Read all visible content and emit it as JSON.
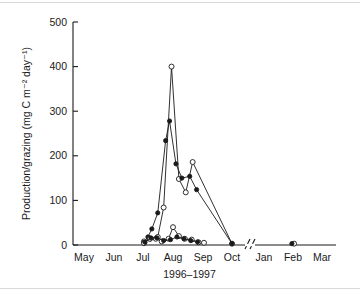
{
  "figure": {
    "background": "#ffffff",
    "ink_color": "#1a1a1a",
    "border_color": "#d9d9d9"
  },
  "chart_data": {
    "type": "line",
    "title": "",
    "subtitle": "",
    "xlabel": "1996–1997",
    "ylabel": "Production/grazing (mg C m⁻² day⁻¹)",
    "ylim": [
      0,
      500
    ],
    "yticks": [
      0,
      100,
      200,
      300,
      400,
      500
    ],
    "ytick_labels": [
      "0",
      "100",
      "200",
      "300",
      "400",
      "500"
    ],
    "xtick_labels": [
      "May",
      "Jun",
      "Jul",
      "Aug",
      "Sep",
      "Oct",
      "Jan",
      "Feb",
      "Mar"
    ],
    "x_axis_break": {
      "present": true,
      "between": [
        "Oct",
        "Jan"
      ],
      "glyph": "//"
    },
    "grid": false,
    "legend": {
      "present": false,
      "position": "none"
    },
    "marker_styles": {
      "open": "open-circle",
      "filled": "filled-circle"
    },
    "series": [
      {
        "name": "production-open-circles",
        "marker": "open-circle",
        "points": [
          {
            "x": "Jul-02",
            "y": 8
          },
          {
            "x": "Jul-08",
            "y": 14
          },
          {
            "x": "Jul-16",
            "y": 18
          },
          {
            "x": "Jul-22",
            "y": 84
          },
          {
            "x": "Jul-30",
            "y": 400
          },
          {
            "x": "Aug-07",
            "y": 148
          },
          {
            "x": "Aug-14",
            "y": 118
          },
          {
            "x": "Aug-21",
            "y": 186
          },
          {
            "x": "Oct-01",
            "y": 3
          },
          {
            "x": "Feb-10",
            "y": 3
          }
        ]
      },
      {
        "name": "grazing-filled-circles",
        "marker": "filled-circle",
        "points": [
          {
            "x": "Jul-02",
            "y": 6
          },
          {
            "x": "Jul-06",
            "y": 18
          },
          {
            "x": "Jul-10",
            "y": 36
          },
          {
            "x": "Jul-16",
            "y": 72
          },
          {
            "x": "Jul-24",
            "y": 234
          },
          {
            "x": "Jul-28",
            "y": 278
          },
          {
            "x": "Aug-04",
            "y": 182
          },
          {
            "x": "Aug-10",
            "y": 150
          },
          {
            "x": "Aug-18",
            "y": 154
          },
          {
            "x": "Aug-25",
            "y": 124
          },
          {
            "x": "Oct-01",
            "y": 3
          },
          {
            "x": "Feb-06",
            "y": 3
          }
        ]
      },
      {
        "name": "low-series-open-circles",
        "marker": "open-circle",
        "points": [
          {
            "x": "Jul-02",
            "y": 4
          },
          {
            "x": "Jul-08",
            "y": 14
          },
          {
            "x": "Jul-14",
            "y": 14
          },
          {
            "x": "Jul-20",
            "y": 8
          },
          {
            "x": "Jul-27",
            "y": 14
          },
          {
            "x": "Aug-01",
            "y": 40
          },
          {
            "x": "Aug-07",
            "y": 20
          },
          {
            "x": "Aug-13",
            "y": 14
          },
          {
            "x": "Aug-20",
            "y": 12
          },
          {
            "x": "Aug-27",
            "y": 6
          },
          {
            "x": "Sep-02",
            "y": 5
          }
        ]
      },
      {
        "name": "low-series-filled-circles",
        "marker": "filled-circle",
        "points": [
          {
            "x": "Jul-03",
            "y": 6
          },
          {
            "x": "Jul-09",
            "y": 16
          },
          {
            "x": "Jul-15",
            "y": 16
          },
          {
            "x": "Jul-22",
            "y": 10
          },
          {
            "x": "Jul-29",
            "y": 12
          },
          {
            "x": "Aug-05",
            "y": 18
          },
          {
            "x": "Aug-12",
            "y": 14
          },
          {
            "x": "Aug-19",
            "y": 10
          },
          {
            "x": "Aug-26",
            "y": 7
          }
        ]
      }
    ]
  }
}
